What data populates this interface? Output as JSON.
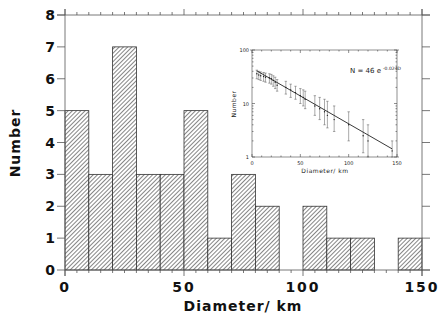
{
  "chart_data": [
    {
      "type": "bar",
      "title": "",
      "xlabel": "Diameter/ km",
      "ylabel": "Number",
      "bin_width": 10,
      "bin_starts": [
        0,
        10,
        20,
        30,
        40,
        50,
        60,
        70,
        80,
        90,
        100,
        110,
        120,
        130,
        140
      ],
      "values": [
        5,
        3,
        7,
        3,
        3,
        5,
        1,
        3,
        2,
        0,
        2,
        1,
        1,
        0,
        1
      ],
      "xlim": [
        0,
        150
      ],
      "ylim": [
        0,
        8
      ],
      "xticks": [
        "0",
        "50",
        "100",
        "150"
      ],
      "yticks": [
        "0",
        "1",
        "2",
        "3",
        "4",
        "5",
        "6",
        "7",
        "8"
      ],
      "fill": "hatched",
      "grid": false
    },
    {
      "type": "scatter",
      "title": "",
      "xlabel": "Diameter/ km",
      "ylabel": "Number",
      "yscale": "log",
      "xlim": [
        0,
        150
      ],
      "ylim": [
        1,
        100
      ],
      "xticks": [
        "0",
        "50",
        "100",
        "150"
      ],
      "yticks": [
        "1",
        "10",
        "100"
      ],
      "annotation": "N = 46 e",
      "annotation_exponent": "-0.024D",
      "fit": {
        "a": 46,
        "b": -0.024
      },
      "points": [
        {
          "x": 5,
          "y": 36,
          "lo": 29,
          "hi": 42
        },
        {
          "x": 7,
          "y": 34,
          "lo": 28,
          "hi": 40
        },
        {
          "x": 9,
          "y": 33,
          "lo": 27,
          "hi": 39
        },
        {
          "x": 12,
          "y": 32,
          "lo": 26,
          "hi": 38
        },
        {
          "x": 14,
          "y": 31,
          "lo": 25,
          "hi": 37
        },
        {
          "x": 18,
          "y": 30,
          "lo": 24,
          "hi": 36
        },
        {
          "x": 20,
          "y": 29,
          "lo": 23,
          "hi": 35
        },
        {
          "x": 22,
          "y": 27,
          "lo": 21,
          "hi": 33
        },
        {
          "x": 24,
          "y": 25,
          "lo": 19,
          "hi": 31
        },
        {
          "x": 26,
          "y": 22,
          "lo": 17,
          "hi": 28
        },
        {
          "x": 35,
          "y": 20,
          "lo": 15,
          "hi": 26
        },
        {
          "x": 40,
          "y": 18,
          "lo": 13,
          "hi": 23
        },
        {
          "x": 45,
          "y": 16,
          "lo": 12,
          "hi": 21
        },
        {
          "x": 50,
          "y": 14,
          "lo": 10,
          "hi": 19
        },
        {
          "x": 53,
          "y": 13,
          "lo": 9,
          "hi": 18
        },
        {
          "x": 55,
          "y": 12,
          "lo": 8,
          "hi": 17
        },
        {
          "x": 65,
          "y": 9,
          "lo": 6,
          "hi": 14
        },
        {
          "x": 70,
          "y": 8,
          "lo": 5,
          "hi": 13
        },
        {
          "x": 75,
          "y": 7,
          "lo": 4,
          "hi": 12
        },
        {
          "x": 78,
          "y": 6,
          "lo": 3.5,
          "hi": 11
        },
        {
          "x": 85,
          "y": 5,
          "lo": 3,
          "hi": 9
        },
        {
          "x": 100,
          "y": 4,
          "lo": 2,
          "hi": 7
        },
        {
          "x": 115,
          "y": 2.5,
          "lo": 1.2,
          "hi": 5
        },
        {
          "x": 120,
          "y": 2,
          "lo": 1,
          "hi": 4
        },
        {
          "x": 145,
          "y": 1.3,
          "lo": 1,
          "hi": 2
        }
      ]
    }
  ],
  "labels": {
    "main_xlabel": "Diameter/ km",
    "main_ylabel": "Number",
    "inset_xlabel": "Diameter/ km",
    "inset_ylabel": "Number",
    "equation": "N = 46 e",
    "equation_exp": "-0.024D",
    "main_xticks": [
      "0",
      "50",
      "100",
      "150"
    ],
    "main_yticks": [
      "0",
      "1",
      "2",
      "3",
      "4",
      "5",
      "6",
      "7",
      "8"
    ],
    "inset_xticks": [
      "0",
      "50",
      "100",
      "150"
    ],
    "inset_yticks": [
      "1",
      "10",
      "100"
    ]
  }
}
